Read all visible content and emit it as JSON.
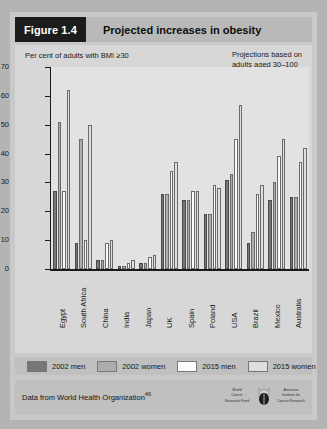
{
  "figure": {
    "number_label": "Figure 1.4",
    "title": "Projected increases in obesity"
  },
  "panel": {
    "y_axis_caption": "Per cent of adults with BMI ≥30",
    "projection_note": "Projections based on\nadults aged 30–100",
    "watermark": "Copyright\nof the\nWorld\nCancer\nResearch\nFund"
  },
  "legend": {
    "items": [
      {
        "label": "2002 men",
        "color": "#777777",
        "icon": "legend-swatch"
      },
      {
        "label": "2002 women",
        "color": "#adadad",
        "icon": "legend-swatch"
      },
      {
        "label": "2015 men",
        "color": "#fbfbfb",
        "icon": "legend-swatch"
      },
      {
        "label": "2015 women",
        "color": "#dedede",
        "icon": "legend-swatch"
      }
    ]
  },
  "footer": {
    "source": "Data from World Health Organization",
    "source_ref": "46",
    "logo_left": "World\nCancer\nResearch Fund",
    "logo_right": "American\nInstitute for\nCancer Research",
    "logo_icon": "wcrf-aicr-logo"
  },
  "chart_data": {
    "type": "bar",
    "title": "Projected increases in obesity",
    "xlabel": "",
    "ylabel": "Per cent of adults with BMI ≥30",
    "ylim": [
      0,
      70
    ],
    "yticks": [
      0,
      10,
      20,
      30,
      40,
      50,
      60,
      70
    ],
    "grid": false,
    "legend_position": "below-plot",
    "categories": [
      "Egypt",
      "South Africa",
      "China",
      "India",
      "Japan",
      "UK",
      "Spain",
      "Poland",
      "USA",
      "Brazil",
      "Mexico",
      "Australia"
    ],
    "series": [
      {
        "name": "2002 men",
        "color": "#777777",
        "values": [
          27,
          9,
          3,
          1,
          2,
          26,
          24,
          19,
          31,
          9,
          24,
          25
        ]
      },
      {
        "name": "2002 women",
        "color": "#adadad",
        "values": [
          51,
          45,
          3,
          1,
          2,
          26,
          24,
          19,
          33,
          13,
          30,
          25
        ]
      },
      {
        "name": "2015 men",
        "color": "#fbfbfb",
        "values": [
          27,
          10,
          9,
          2,
          4,
          34,
          27,
          29,
          45,
          26,
          39,
          37
        ]
      },
      {
        "name": "2015 women",
        "color": "#dedede",
        "values": [
          62,
          50,
          10,
          3,
          5,
          37,
          27,
          28,
          57,
          29,
          45,
          42
        ]
      }
    ]
  }
}
